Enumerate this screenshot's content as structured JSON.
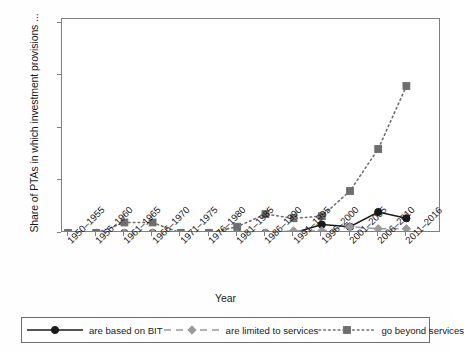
{
  "axes": {
    "ylabel": "Share of PTAs in which investment provisions ...",
    "xlabel": "Year",
    "yticks": [
      "0",
      "25",
      "50",
      "75",
      "100"
    ]
  },
  "legend": {
    "items": [
      {
        "label": "are based on BIT",
        "glyph": "solid-circle-marker"
      },
      {
        "label": "are limited to services",
        "glyph": "dashed-diamond-marker"
      },
      {
        "label": "go beyond services",
        "glyph": "dotted-square-marker"
      }
    ]
  },
  "chart_data": {
    "type": "line",
    "title": "",
    "xlabel": "Year",
    "ylabel": "Share of PTAs in which investment provisions ...",
    "categories": [
      "1950–1955",
      "1956–1960",
      "1961–1965",
      "1966–1970",
      "1971–1975",
      "1976–1980",
      "1981–1985",
      "1986–1990",
      "1991–1995",
      "1996–2000",
      "2001–2005",
      "2006–2010",
      "2011–2016"
    ],
    "ylim": [
      0,
      100
    ],
    "yticks": [
      0,
      25,
      50,
      75,
      100
    ],
    "grid": false,
    "legend_position": "bottom",
    "series": [
      {
        "name": "are based on BIT",
        "color": "#1a1a1a",
        "linestyle": "solid",
        "marker": "circle",
        "values": [
          0,
          0,
          0,
          0,
          0,
          0,
          0,
          0,
          0,
          4,
          3,
          10,
          7
        ]
      },
      {
        "name": "are limited to services",
        "color": "#9a9a9a",
        "linestyle": "dashed",
        "marker": "diamond",
        "values": [
          0,
          0,
          0,
          0,
          0,
          0,
          0,
          0,
          1,
          1,
          3,
          2,
          2
        ]
      },
      {
        "name": "go beyond services",
        "color": "#6e6e6e",
        "linestyle": "dotted",
        "marker": "square",
        "values": [
          0,
          0,
          5,
          5,
          0,
          0,
          3,
          9,
          7,
          8,
          20,
          40,
          70
        ]
      }
    ]
  }
}
